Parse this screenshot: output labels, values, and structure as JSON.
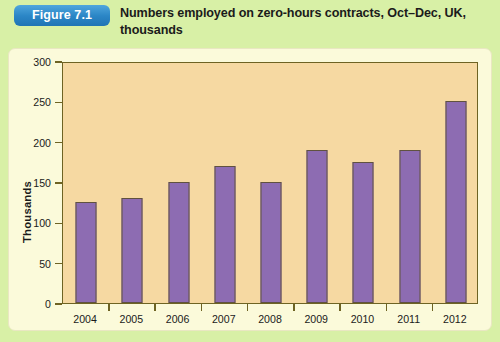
{
  "figure": {
    "badge_label": "Figure 7.1",
    "title": "Numbers employed on zero-hours contracts, Oct–Dec, UK, thousands",
    "badge_color": "#2b86c6",
    "page_background": "#d8f0a6",
    "card_background": "#fbfada"
  },
  "chart_data": {
    "type": "bar",
    "title": "Numbers employed on zero-hours contracts, Oct–Dec, UK, thousands",
    "categories": [
      "2004",
      "2005",
      "2006",
      "2007",
      "2008",
      "2009",
      "2010",
      "2011",
      "2012"
    ],
    "values": [
      125,
      130,
      150,
      170,
      150,
      190,
      175,
      190,
      250
    ],
    "series": [
      {
        "name": "Zero-hours contracts",
        "values": [
          125,
          130,
          150,
          170,
          150,
          190,
          175,
          190,
          250
        ]
      }
    ],
    "xlabel": "",
    "ylabel": "Thousands",
    "ylim": [
      0,
      300
    ],
    "ytick_values": [
      0,
      50,
      100,
      150,
      200,
      250,
      300
    ],
    "ytick_labels": [
      "0",
      "50",
      "100",
      "150",
      "200",
      "250",
      "300"
    ],
    "grid": false,
    "legend": false,
    "bar_color": "#8d6cb2",
    "bar_edge_color": "#60523f",
    "plot_background": "#f6d9a2",
    "axis_color": "#6e6323"
  }
}
